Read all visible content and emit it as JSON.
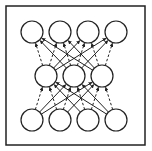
{
  "diagram": {
    "type": "neural-network",
    "frame": {
      "x": 6,
      "y": 6,
      "w": 139,
      "h": 139,
      "stroke": "#222222"
    },
    "node_radius": 11,
    "node_stroke": "#222222",
    "node_fill": "#ffffff",
    "layers": [
      {
        "name": "top",
        "nodes": [
          {
            "x": 32,
            "y": 32
          },
          {
            "x": 60,
            "y": 32
          },
          {
            "x": 88,
            "y": 32
          },
          {
            "x": 116,
            "y": 32
          }
        ]
      },
      {
        "name": "middle",
        "nodes": [
          {
            "x": 46,
            "y": 76
          },
          {
            "x": 74,
            "y": 76
          },
          {
            "x": 102,
            "y": 76
          }
        ]
      },
      {
        "name": "bottom",
        "nodes": [
          {
            "x": 32,
            "y": 120
          },
          {
            "x": 60,
            "y": 120
          },
          {
            "x": 88,
            "y": 120
          },
          {
            "x": 116,
            "y": 120
          }
        ]
      }
    ],
    "edges": [
      {
        "from": [
          1,
          0
        ],
        "to": [
          0,
          0
        ],
        "style": "dashed"
      },
      {
        "from": [
          1,
          0
        ],
        "to": [
          0,
          1
        ],
        "style": "dashed"
      },
      {
        "from": [
          1,
          0
        ],
        "to": [
          0,
          2
        ],
        "style": "solid"
      },
      {
        "from": [
          1,
          0
        ],
        "to": [
          0,
          3
        ],
        "style": "solid"
      },
      {
        "from": [
          1,
          1
        ],
        "to": [
          0,
          0
        ],
        "style": "solid"
      },
      {
        "from": [
          1,
          1
        ],
        "to": [
          0,
          1
        ],
        "style": "dashed"
      },
      {
        "from": [
          1,
          1
        ],
        "to": [
          0,
          2
        ],
        "style": "dashed"
      },
      {
        "from": [
          1,
          1
        ],
        "to": [
          0,
          3
        ],
        "style": "solid"
      },
      {
        "from": [
          1,
          2
        ],
        "to": [
          0,
          0
        ],
        "style": "solid"
      },
      {
        "from": [
          1,
          2
        ],
        "to": [
          0,
          1
        ],
        "style": "solid"
      },
      {
        "from": [
          1,
          2
        ],
        "to": [
          0,
          2
        ],
        "style": "dashed"
      },
      {
        "from": [
          1,
          2
        ],
        "to": [
          0,
          3
        ],
        "style": "dashed"
      },
      {
        "from": [
          2,
          0
        ],
        "to": [
          1,
          0
        ],
        "style": "dashed"
      },
      {
        "from": [
          2,
          0
        ],
        "to": [
          1,
          1
        ],
        "style": "solid"
      },
      {
        "from": [
          2,
          0
        ],
        "to": [
          1,
          2
        ],
        "style": "solid"
      },
      {
        "from": [
          2,
          1
        ],
        "to": [
          1,
          0
        ],
        "style": "dashed"
      },
      {
        "from": [
          2,
          1
        ],
        "to": [
          1,
          1
        ],
        "style": "dashed"
      },
      {
        "from": [
          2,
          1
        ],
        "to": [
          1,
          2
        ],
        "style": "solid"
      },
      {
        "from": [
          2,
          2
        ],
        "to": [
          1,
          0
        ],
        "style": "solid"
      },
      {
        "from": [
          2,
          2
        ],
        "to": [
          1,
          1
        ],
        "style": "dashed"
      },
      {
        "from": [
          2,
          2
        ],
        "to": [
          1,
          2
        ],
        "style": "dashed"
      },
      {
        "from": [
          2,
          3
        ],
        "to": [
          1,
          0
        ],
        "style": "solid"
      },
      {
        "from": [
          2,
          3
        ],
        "to": [
          1,
          1
        ],
        "style": "solid"
      },
      {
        "from": [
          2,
          3
        ],
        "to": [
          1,
          2
        ],
        "style": "dashed"
      }
    ]
  }
}
